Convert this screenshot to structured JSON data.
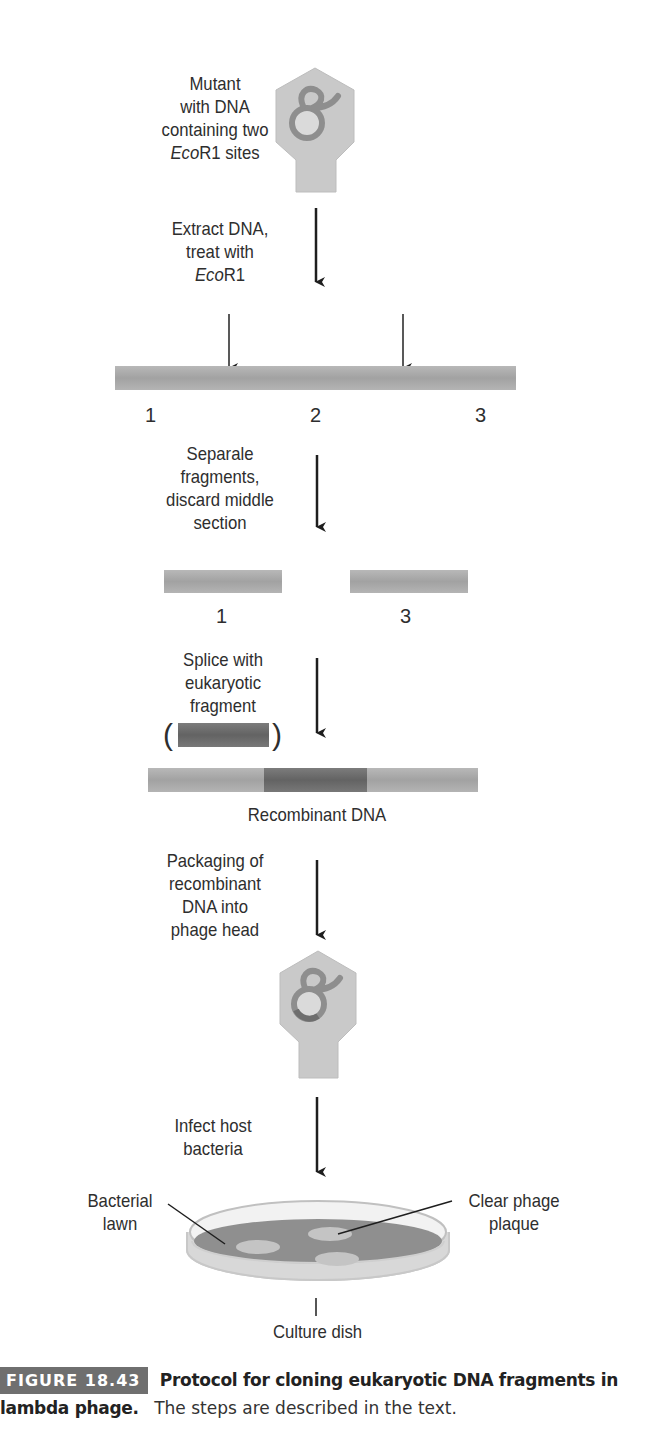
{
  "figure": {
    "steps": [
      {
        "id": "mutant",
        "lines": [
          "Mutant",
          "with DNA",
          "containing two"
        ],
        "italic_prefix": "Eco",
        "suffix": "R1 sites"
      },
      {
        "id": "extract",
        "lines": [
          "Extract DNA,",
          "treat with"
        ],
        "italic_prefix": "Eco",
        "suffix": "R1"
      },
      {
        "id": "separate",
        "lines": [
          "Separale",
          "fragments,",
          "discard middle",
          "section"
        ]
      },
      {
        "id": "splice",
        "lines": [
          "Splice with",
          "eukaryotic",
          "fragment"
        ]
      },
      {
        "id": "packaging",
        "lines": [
          "Packaging of",
          "recombinant",
          "DNA into",
          "phage head"
        ]
      },
      {
        "id": "infect",
        "lines": [
          "Infect host",
          "bacteria"
        ]
      }
    ],
    "fragment_labels_full": [
      "1",
      "2",
      "3"
    ],
    "fragment_labels_kept": [
      "1",
      "3"
    ],
    "recombinant_label": "Recombinant DNA",
    "dish_labels": {
      "lawn": [
        "Bacterial",
        "lawn"
      ],
      "plaque": [
        "Clear phage",
        "plaque"
      ],
      "dish": "Culture dish"
    },
    "colors": {
      "phage_fill": "#c9c9c9",
      "phage_stroke": "#b5b5b5",
      "dna_loop": "#8e8e8e",
      "dna_bar": "#a9a9a9",
      "eukaryotic_bar": "#6e6e6e",
      "lawn": "#8f8f8f",
      "plaque": "#c4c4c4",
      "arrow": "#1e1e1e",
      "badge_bg": "#6f6f6f"
    }
  },
  "caption": {
    "badge": "FIGURE 18.43",
    "title": "Protocol for cloning eukaryotic DNA fragments in lambda phage.",
    "body": "The steps are described in the text."
  }
}
